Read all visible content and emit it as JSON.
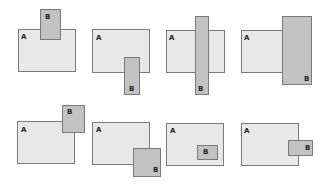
{
  "figure": {
    "colors": {
      "a_fill": "#e8e8e8",
      "b_fill": "#c2c2c2",
      "border": "#7a7a7a",
      "label": "#222222"
    },
    "panels": [
      {
        "id": 1,
        "a": {
          "label": "A",
          "x": 18,
          "y": 29,
          "w": 58,
          "h": 43,
          "label_x": 21,
          "label_y": 34
        },
        "b": {
          "label": "B",
          "x": 40,
          "y": 9,
          "w": 21,
          "h": 31,
          "label_x": 45,
          "label_y": 14
        }
      },
      {
        "id": 2,
        "a": {
          "label": "A",
          "x": 92,
          "y": 29,
          "w": 58,
          "h": 44,
          "label_x": 96,
          "label_y": 35
        },
        "b": {
          "label": "B",
          "x": 124,
          "y": 57,
          "w": 16,
          "h": 38,
          "label_x": 129,
          "label_y": 86
        }
      },
      {
        "id": 3,
        "a": {
          "label": "A",
          "x": 166,
          "y": 30,
          "w": 59,
          "h": 43,
          "label_x": 169,
          "label_y": 35
        },
        "b": {
          "label": "B",
          "x": 195,
          "y": 16,
          "w": 14,
          "h": 79,
          "label_x": 198,
          "label_y": 86
        }
      },
      {
        "id": 4,
        "a": {
          "label": "A",
          "x": 241,
          "y": 30,
          "w": 42,
          "h": 43,
          "label_x": 244,
          "label_y": 35
        },
        "b": {
          "label": "B",
          "x": 282,
          "y": 16,
          "w": 30,
          "h": 69,
          "label_x": 304,
          "label_y": 76
        }
      },
      {
        "id": 5,
        "a": {
          "label": "A",
          "x": 17,
          "y": 121,
          "w": 58,
          "h": 43,
          "label_x": 21,
          "label_y": 127
        },
        "b": {
          "label": "B",
          "x": 62,
          "y": 105,
          "w": 23,
          "h": 28,
          "label_x": 67,
          "label_y": 109
        }
      },
      {
        "id": 6,
        "a": {
          "label": "A",
          "x": 92,
          "y": 122,
          "w": 58,
          "h": 43,
          "label_x": 96,
          "label_y": 127
        },
        "b": {
          "label": "B",
          "x": 133,
          "y": 148,
          "w": 28,
          "h": 29,
          "label_x": 153,
          "label_y": 167
        }
      },
      {
        "id": 7,
        "a": {
          "label": "A",
          "x": 166,
          "y": 123,
          "w": 58,
          "h": 43,
          "label_x": 170,
          "label_y": 128
        },
        "b": {
          "label": "B",
          "x": 197,
          "y": 145,
          "w": 21,
          "h": 15,
          "label_x": 203,
          "label_y": 149
        }
      },
      {
        "id": 8,
        "a": {
          "label": "A",
          "x": 241,
          "y": 123,
          "w": 58,
          "h": 43,
          "label_x": 244,
          "label_y": 128
        },
        "b": {
          "label": "B",
          "x": 288,
          "y": 140,
          "w": 25,
          "h": 16,
          "label_x": 305,
          "label_y": 145
        }
      }
    ]
  }
}
